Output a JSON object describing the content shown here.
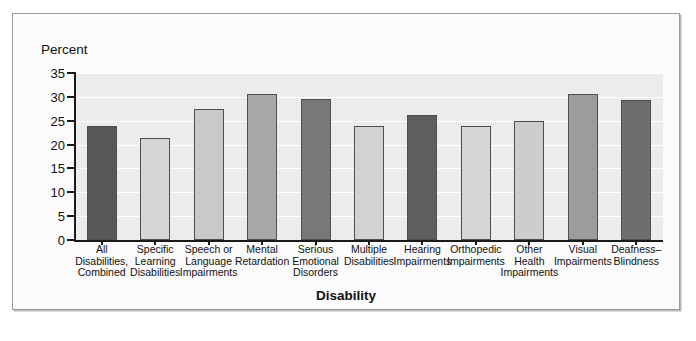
{
  "figure": {
    "percent_axis_label": "Percent",
    "xaxis_title": "Disability"
  },
  "chart_data": {
    "type": "bar",
    "title": "",
    "xlabel": "Disability",
    "ylabel": "Percent",
    "ylim": [
      0,
      35
    ],
    "ytick_labels": [
      "35",
      "30",
      "25",
      "20",
      "15",
      "10",
      "5",
      "0"
    ],
    "ytick_values": [
      35,
      30,
      25,
      20,
      15,
      10,
      5,
      0
    ],
    "grid": true,
    "legend": "none",
    "categories": [
      "All Disabilities, Combined",
      "Specific Learning Disabilities",
      "Speech or Language Impairments",
      "Mental Retardation",
      "Serious Emotional Disorders",
      "Multiple Disabilities",
      "Hearing Impairments",
      "Orthopedic Impairments",
      "Other Health Impairments",
      "Visual Impairments",
      "Deafness–Blindness"
    ],
    "category_lines": [
      [
        "All",
        "Disabilities,",
        "Combined"
      ],
      [
        "Specific",
        "Learning",
        "Disabilities"
      ],
      [
        "Speech or",
        "Language",
        "Impairments"
      ],
      [
        "Mental",
        "Retardation"
      ],
      [
        "Serious",
        "Emotional",
        "Disorders"
      ],
      [
        "Multiple",
        "Disabilities"
      ],
      [
        "Hearing",
        "Impairments"
      ],
      [
        "Orthopedic",
        "Impairments"
      ],
      [
        "Other",
        "Health",
        "Impairments"
      ],
      [
        "Visual",
        "Impairments"
      ],
      [
        "Deafness–",
        "Blindness"
      ]
    ],
    "values": [
      24.0,
      21.3,
      27.5,
      30.7,
      29.5,
      24.0,
      26.3,
      23.8,
      25.0,
      30.5,
      29.3
    ],
    "bar_colors": [
      "#585858",
      "#d6d6d6",
      "#c9c9c9",
      "#a8a8a8",
      "#787878",
      "#d2d2d2",
      "#5e5e5e",
      "#d6d6d6",
      "#cdcdcd",
      "#9c9c9c",
      "#6e6e6e"
    ]
  },
  "colors": {
    "plot_background": "#ececec",
    "gridline": "#ffffff",
    "axis": "#1a1a1a",
    "panel_border": "#9a9a9a",
    "bar_outline": "#4e4e4e"
  }
}
